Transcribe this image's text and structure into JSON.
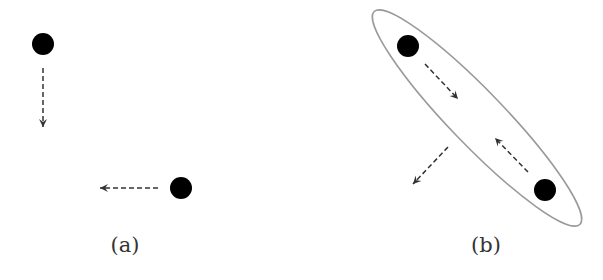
{
  "panels": [
    {
      "id": "a",
      "label": "(a)",
      "particles": [
        {
          "cx": 43,
          "cy": 44,
          "r": 11
        },
        {
          "cx": 181,
          "cy": 188,
          "r": 11
        }
      ],
      "arrows": [
        {
          "x1": 43,
          "y1": 68,
          "x2": 43,
          "y2": 127
        },
        {
          "x1": 158,
          "y1": 188,
          "x2": 100,
          "y2": 188
        }
      ]
    },
    {
      "id": "b",
      "label": "(b)",
      "cluster": {
        "cx": 477,
        "cy": 118,
        "rx": 148,
        "ry": 27,
        "rotate": 46
      },
      "particles": [
        {
          "cx": 408,
          "cy": 46,
          "r": 11
        },
        {
          "cx": 545,
          "cy": 190,
          "r": 11
        }
      ],
      "arrows": [
        {
          "x1": 425,
          "y1": 64,
          "x2": 458,
          "y2": 99
        },
        {
          "x1": 528,
          "y1": 172,
          "x2": 495,
          "y2": 138
        },
        {
          "x1": 448,
          "y1": 147,
          "x2": 413,
          "y2": 184
        }
      ]
    }
  ],
  "colors": {
    "particle": "#000000",
    "arrow": "#333333",
    "cluster": "#9a9a9a",
    "label": "#333333"
  }
}
